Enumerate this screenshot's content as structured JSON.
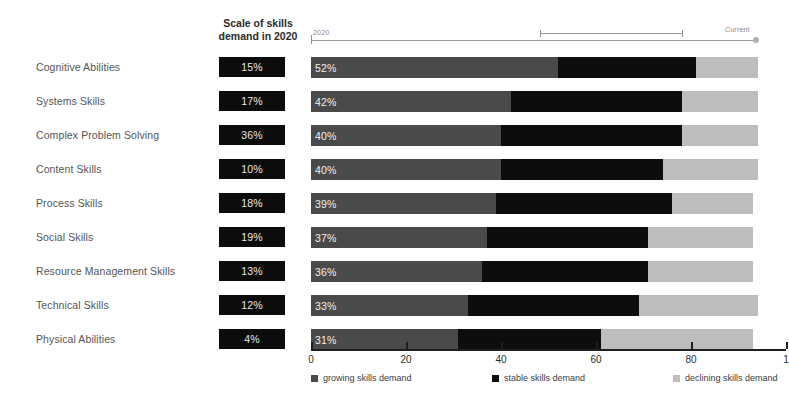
{
  "scale_column": {
    "header_line1": "Scale of skills",
    "header_line2": "demand in 2020"
  },
  "annotation": {
    "left_label": "2020",
    "right_label": "Current"
  },
  "chart_data": {
    "type": "bar",
    "subtype": "stacked-horizontal-100",
    "title": "",
    "xlabel": "",
    "ylabel": "",
    "xlim": [
      0,
      100
    ],
    "xticks": [
      0,
      20,
      40,
      60,
      80,
      100
    ],
    "xtick_labels": [
      "0",
      "20",
      "40",
      "60",
      "80",
      "1"
    ],
    "grid": false,
    "legend_position": "bottom",
    "categories": [
      "Cognitive Abilities",
      "Systems Skills",
      "Complex Problem Solving",
      "Content Skills",
      "Process Skills",
      "Social Skills",
      "Resource Management Skills",
      "Technical Skills",
      "Physical Abilities"
    ],
    "series": [
      {
        "name": "growing skills demand",
        "color": "#4a4a4a",
        "values": [
          52,
          42,
          40,
          40,
          39,
          37,
          36,
          33,
          31
        ]
      },
      {
        "name": "stable skills demand",
        "color": "#0d0d0d",
        "values": [
          29,
          36,
          38,
          34,
          37,
          34,
          35,
          36,
          30
        ]
      },
      {
        "name": "declining skills demand",
        "color": "#bdbdbd",
        "values": [
          13,
          16,
          16,
          20,
          17,
          22,
          22,
          25,
          32
        ]
      }
    ],
    "bar_value_labels": [
      "52%",
      "42%",
      "40%",
      "40%",
      "39%",
      "37%",
      "36%",
      "33%",
      "31%"
    ],
    "scale_of_skills_demand_2020": [
      "15%",
      "17%",
      "36%",
      "10%",
      "18%",
      "19%",
      "13%",
      "12%",
      "4%"
    ]
  },
  "legend": [
    {
      "label": "growing skills demand",
      "color": "#4a4a4a"
    },
    {
      "label": "stable skills demand",
      "color": "#0d0d0d"
    },
    {
      "label": "declining skills demand",
      "color": "#bdbdbd"
    }
  ]
}
